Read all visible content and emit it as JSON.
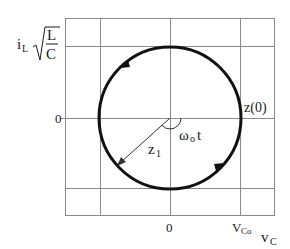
{
  "figure": {
    "y_axis_label": {
      "var": "i",
      "sub": "L",
      "sqrt_num": "L",
      "sqrt_den": "C"
    },
    "x_axis_label": {
      "var": "v",
      "sub": "C"
    },
    "ticks": {
      "y_zero": "0",
      "x_zero": "0",
      "x_vco_var": "V",
      "x_vco_sub": "Co"
    },
    "annotations": {
      "z0": "z(0)",
      "z1_var": "z",
      "z1_sub": "1",
      "angle_var": "ω",
      "angle_sub": "o",
      "angle_t": "t"
    },
    "colors": {
      "grid": "#8a8a8a",
      "circle": "#111111",
      "text": "#1a1a1a"
    }
  }
}
